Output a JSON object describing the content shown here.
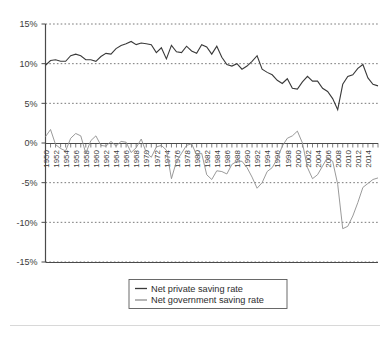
{
  "chart_data": {
    "type": "line",
    "title": "",
    "subtitle": "",
    "xlabel": "",
    "ylabel": "",
    "xlim": [
      1950,
      2016
    ],
    "ylim": [
      -15,
      15
    ],
    "ytick_labels": [
      "15%",
      "10%",
      "5%",
      "0%",
      "-5%",
      "-10%",
      "-15%"
    ],
    "ytick_values": [
      15,
      10,
      5,
      0,
      -5,
      -10,
      -15
    ],
    "grid": "horizontal-dotted",
    "grid_color": "#555555",
    "legend_position": "bottom-center",
    "x": [
      1950,
      1951,
      1952,
      1953,
      1954,
      1955,
      1956,
      1957,
      1958,
      1959,
      1960,
      1961,
      1962,
      1963,
      1964,
      1965,
      1966,
      1967,
      1968,
      1969,
      1970,
      1971,
      1972,
      1973,
      1974,
      1975,
      1976,
      1977,
      1978,
      1979,
      1980,
      1981,
      1982,
      1983,
      1984,
      1985,
      1986,
      1987,
      1988,
      1989,
      1990,
      1991,
      1992,
      1993,
      1994,
      1995,
      1996,
      1997,
      1998,
      1999,
      2000,
      2001,
      2002,
      2003,
      2004,
      2005,
      2006,
      2007,
      2008,
      2009,
      2010,
      2011,
      2012,
      2013,
      2014,
      2015,
      2016
    ],
    "xtick_labels": [
      "1950",
      "1952",
      "1954",
      "1956",
      "1958",
      "1960",
      "1962",
      "1964",
      "1966",
      "1968",
      "1970",
      "1972",
      "1974",
      "1976",
      "1978",
      "1980",
      "1982",
      "1984",
      "1986",
      "1988",
      "1990",
      "1992",
      "1994",
      "1996",
      "1998",
      "2000",
      "2002",
      "2004",
      "2006",
      "2008",
      "2010",
      "2012",
      "2014"
    ],
    "xtick_minor_interval": 1,
    "xtick_label_interval": 2,
    "series": [
      {
        "name": "Net private saving rate",
        "color": "#3a3a3a",
        "values": [
          9.8,
          10.4,
          10.5,
          10.3,
          10.3,
          11.0,
          11.2,
          11.0,
          10.5,
          10.5,
          10.3,
          10.9,
          11.3,
          11.2,
          11.9,
          12.3,
          12.5,
          12.8,
          12.4,
          12.6,
          12.5,
          12.4,
          11.4,
          12.0,
          10.6,
          12.3,
          11.5,
          11.4,
          12.2,
          11.6,
          11.3,
          12.4,
          12.1,
          11.2,
          12.2,
          10.8,
          9.9,
          9.7,
          10.0,
          9.3,
          9.7,
          10.3,
          11.0,
          9.3,
          8.9,
          8.6,
          7.9,
          7.5,
          8.1,
          6.9,
          6.8,
          7.7,
          8.4,
          7.8,
          7.8,
          6.9,
          6.5,
          5.6,
          4.2,
          7.4,
          8.4,
          8.6,
          9.4,
          9.9,
          8.2,
          7.4,
          7.2
        ]
      },
      {
        "name": "Net government saving rate",
        "color": "#8e8e8e",
        "values": [
          0.8,
          1.7,
          -0.2,
          -0.7,
          -1.0,
          0.6,
          1.2,
          0.9,
          -1.3,
          0.3,
          0.9,
          -0.3,
          -0.4,
          0.2,
          -0.4,
          0.2,
          0.1,
          -1.2,
          -0.6,
          0.5,
          -1.2,
          -1.8,
          -0.5,
          -0.3,
          -0.9,
          -4.5,
          -2.3,
          -1.3,
          -0.3,
          -0.1,
          -1.5,
          -1.3,
          -4.0,
          -4.6,
          -3.5,
          -3.6,
          -3.9,
          -2.7,
          -2.3,
          -2.3,
          -3.1,
          -4.3,
          -5.7,
          -5.0,
          -3.6,
          -3.1,
          -2.0,
          -0.4,
          0.6,
          0.9,
          1.5,
          0.0,
          -3.1,
          -4.5,
          -4.0,
          -2.9,
          -1.8,
          -2.3,
          -5.2,
          -10.8,
          -10.5,
          -9.2,
          -7.5,
          -5.6,
          -5.1,
          -4.6,
          -4.4
        ]
      }
    ]
  },
  "legend": {
    "items": [
      {
        "label": "Net private saving rate",
        "color": "#3a3a3a"
      },
      {
        "label": "Net government saving rate",
        "color": "#8e8e8e"
      }
    ]
  },
  "axes": {
    "y_labels": [
      "15%",
      "10%",
      "5%",
      "0%",
      "-5%",
      "-10%",
      "-15%"
    ]
  }
}
